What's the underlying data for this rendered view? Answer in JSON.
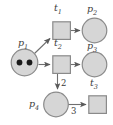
{
  "diagram": {
    "type": "petri-net",
    "colors": {
      "node_fill": "#d6d6d6",
      "node_stroke": "#8a8a8a",
      "arc_stroke": "#6f6f6f",
      "token_fill": "#1a1a1a",
      "label_color": "#3a3a3a",
      "background": "#ffffff"
    },
    "places": [
      {
        "id": "p1",
        "label": "p",
        "sub": "1",
        "tokens": 2,
        "cx": 24.5,
        "cy": 62.5,
        "r": 13.5,
        "label_x": 18,
        "label_y": 40
      },
      {
        "id": "p2",
        "label": "p",
        "sub": "2",
        "tokens": 0,
        "cx": 94.5,
        "cy": 30.5,
        "r": 12.5,
        "label_x": 88,
        "label_y": 6
      },
      {
        "id": "p3",
        "label": "p",
        "sub": "3",
        "tokens": 0,
        "cx": 94.5,
        "cy": 64.5,
        "r": 12.5,
        "label_x": 88,
        "label_y": 42
      },
      {
        "id": "p4",
        "label": "p",
        "sub": "4",
        "tokens": 0,
        "cx": 55.5,
        "cy": 104.5,
        "r": 12.5,
        "label_x": 30,
        "label_y": 100
      }
    ],
    "transitions": [
      {
        "id": "t1",
        "label": "t",
        "sub": "1",
        "x": 52.5,
        "y": 21.5,
        "size": 18,
        "label_x": 54,
        "label_y": 5
      },
      {
        "id": "t2",
        "label": "t",
        "sub": "2",
        "x": 52.5,
        "y": 55.5,
        "size": 18,
        "label_x": 54,
        "label_y": 39
      },
      {
        "id": "t3",
        "label": "t",
        "sub": "3",
        "x": 88.5,
        "y": 96.5,
        "size": 18,
        "label_x": 90,
        "label_y": 80
      }
    ],
    "arcs": [
      {
        "id": "arc-p1-t1",
        "from": "p1",
        "to": "t1",
        "weight": "",
        "weight_x": 0,
        "weight_y": 0
      },
      {
        "id": "arc-p1-t2",
        "from": "p1",
        "to": "t2",
        "weight": "",
        "weight_x": 0,
        "weight_y": 0
      },
      {
        "id": "arc-t1-p2",
        "from": "t1",
        "to": "p2",
        "weight": "",
        "weight_x": 0,
        "weight_y": 0
      },
      {
        "id": "arc-t2-p3",
        "from": "t2",
        "to": "p3",
        "weight": "",
        "weight_x": 0,
        "weight_y": 0
      },
      {
        "id": "arc-t2-p4",
        "from": "t2",
        "to": "p4",
        "weight": "2",
        "weight_x": 62,
        "weight_y": 80
      },
      {
        "id": "arc-p4-t3",
        "from": "p4",
        "to": "t3",
        "weight": "3",
        "weight_x": 71,
        "weight_y": 108
      }
    ]
  }
}
